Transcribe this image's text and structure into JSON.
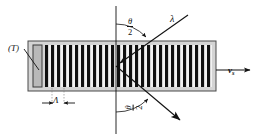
{
  "figure": {
    "colors": {
      "cell_fill": "#d4d4d4",
      "cell_border": "#4a4a4a",
      "grating_bar": "#101010",
      "grating_gap": "#f2f2f2",
      "transducer_fill": "#b9b9b9",
      "transducer_border": "#3a3a3a",
      "line": "#111111",
      "background": "#ffffff"
    }
  },
  "labels": {
    "transducer": "(T)",
    "wavelength": "λ",
    "acoustic_velocity": "v",
    "acoustic_velocity_sub": "s",
    "grating_period": "Λ",
    "bragg_angle_numerator": "θ",
    "bragg_angle_denominator": "2"
  },
  "geometry": {
    "cell": {
      "x": 28,
      "y": 41,
      "width": 188,
      "height": 50
    },
    "transducer": {
      "x": 33,
      "y": 45,
      "width": 9,
      "height": 42
    },
    "grating": {
      "x": 45,
      "y": 45,
      "width": 167,
      "height": 42,
      "bar_count": 28,
      "period_px": 6
    },
    "normal_line": {
      "x": 116,
      "y_top": 6,
      "y_bottom": 134
    },
    "incident_ray": {
      "x1": 188,
      "y1": 15,
      "x2": 116,
      "y2": 66
    },
    "diffracted_ray": {
      "x1": 116,
      "y1": 66,
      "x2": 186,
      "y2": 125
    },
    "velocity_arrow": {
      "x1": 216,
      "y1": 70,
      "x2": 252,
      "y2": 70
    },
    "period_marker": {
      "y": 103,
      "left": 44,
      "right": 72
    },
    "leader_line": {
      "x1": 24,
      "y1": 49,
      "x2": 39,
      "y2": 70
    },
    "angle_arc_top": {
      "cx": 116,
      "cy": 66,
      "radius": 48
    },
    "angle_arc_bottom": {
      "cx": 116,
      "cy": 66,
      "radius": 46
    }
  },
  "chart_data": {
    "type": "diagram",
    "elements": [
      "transducer (T)",
      "acoustic grating with period Λ",
      "incident light beam λ at angle θ/2 from normal",
      "diffracted beam at angle θ/2 below normal",
      "acoustic wave propagation velocity v_s"
    ]
  }
}
